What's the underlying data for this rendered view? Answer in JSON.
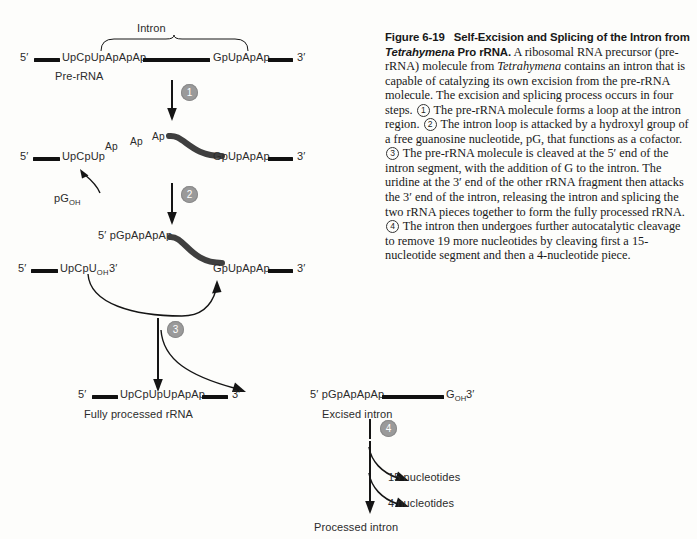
{
  "caption": {
    "figure_label": "Figure 6-19",
    "title": "Self-Excision and Splicing of the Intron from Tetrahymena Pro rRNA.",
    "title_italic_word": "Tetrahymena",
    "body_1": "A ribosomal RNA precursor (pre-rRNA) molecule from ",
    "body_italic_1": "Tetrahymena",
    "body_2": " contains an intron that is capable of catalyzing its own excision from the pre-rRNA molecule. The excision and splicing process occurs in four steps.",
    "step_1_num": "1",
    "body_3": "The pre-rRNA molecule forms a loop at the intron region.",
    "step_2_num": "2",
    "body_4": "The intron loop is attacked by a hydroxyl group of a free guanosine nucleotide, pG, that functions as a cofactor.",
    "step_3_num": "3",
    "body_5": "The pre-rRNA molecule is cleaved at the 5′ end of the intron segment, with the addition of G to the intron. The uridine at the 3′ end of the other rRNA fragment then attacks the 3′ end of the intron, releasing the intron and splicing the two rRNA pieces together to form the fully processed rRNA.",
    "step_4_num": "4",
    "body_6": "The intron then undergoes further autocatalytic cleavage to remove 19 more nucleotides by cleaving first a 15-nucleotide segment and then a 4-nucleotide piece."
  },
  "diagram": {
    "intron_bracket_label": "Intron",
    "stage1": {
      "five_prime": "5′",
      "left_sequence": "UpCpUpApApAp",
      "right_sequence": "GpUpApAp",
      "three_prime": "3′",
      "molecule_label": "Pre-rRNA"
    },
    "stage2": {
      "five_prime": "5′",
      "left_sequence": "UpCpUp",
      "loop_residue_1": "Ap",
      "loop_residue_2": "Ap",
      "loop_residue_3": "Ap",
      "right_sequence": "GpUpApAp",
      "three_prime": "3′",
      "cofactor": "pG",
      "cofactor_sub": "OH"
    },
    "stage3": {
      "intron_five_prime": "5′ pGpApApAp",
      "left_five_prime": "5′",
      "left_sequence": "UpCpU",
      "left_sub": "OH",
      "left_three_prime": "3′",
      "right_sequence": "GpUpApAp",
      "right_three_prime": "3′"
    },
    "stage4": {
      "rrna_five_prime": "5′",
      "rrna_sequence": "UpCpUpUpApAp",
      "rrna_three_prime": "3′",
      "rrna_label": "Fully processed rRNA",
      "intron_five_prime": "5′ pGpApApAp",
      "intron_end": "G",
      "intron_end_sub": "OH",
      "intron_three_prime": "3′",
      "intron_label": "Excised intron"
    },
    "stage5": {
      "cleavage_1": "15 nucleotides",
      "cleavage_2": "4 nucleotides",
      "final_label": "Processed intron"
    },
    "steps": {
      "step1": "1",
      "step2": "2",
      "step3": "3",
      "step4": "4"
    }
  },
  "colors": {
    "rna_bar": "#111111",
    "loop_curve": "#3a3a3a",
    "step_circle": "#9a9a9a",
    "text": "#2b2b2b"
  }
}
